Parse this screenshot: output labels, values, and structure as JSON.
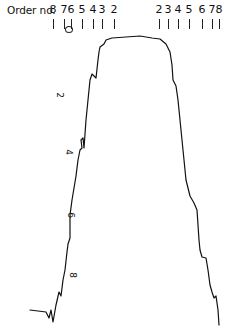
{
  "figure": {
    "order_title": "Order no.",
    "left_orders": [
      {
        "label": "8",
        "x": 53
      },
      {
        "label": "7",
        "x": 64
      },
      {
        "label": "6",
        "x": 71
      },
      {
        "label": "5",
        "x": 82
      },
      {
        "label": "4",
        "x": 93
      },
      {
        "label": "3",
        "x": 102
      },
      {
        "label": "2",
        "x": 114
      }
    ],
    "right_orders": [
      {
        "label": "2",
        "x": 159
      },
      {
        "label": "3",
        "x": 168
      },
      {
        "label": "4",
        "x": 178
      },
      {
        "label": "5",
        "x": 189
      },
      {
        "label": "6",
        "x": 202
      },
      {
        "label": "7",
        "x": 212
      },
      {
        "label": "8",
        "x": 219
      }
    ],
    "zero_marker": "O",
    "inner_labels": [
      {
        "label": "2",
        "x": 57,
        "y": 90
      },
      {
        "label": "4",
        "x": 66,
        "y": 147
      },
      {
        "label": "6",
        "x": 68,
        "y": 210
      },
      {
        "label": "8",
        "x": 70,
        "y": 270
      }
    ],
    "line_color": "#111111"
  },
  "chart_data": {
    "type": "line",
    "title": "Order no.",
    "xlabel": "",
    "ylabel": "",
    "grid": false,
    "legend": "none",
    "top_axis_tick_labels": [
      "8",
      "7",
      "6",
      "5",
      "4",
      "3",
      "2",
      "2",
      "3",
      "4",
      "5",
      "6",
      "7",
      "8"
    ],
    "inner_axis_labels": [
      "2",
      "4",
      "6",
      "8"
    ],
    "series": [
      {
        "name": "band profile (left edge)",
        "points_px": [
          [
            30,
            310
          ],
          [
            46,
            312
          ],
          [
            49,
            318
          ],
          [
            51,
            310
          ],
          [
            53,
            322
          ],
          [
            56,
            305
          ],
          [
            59,
            292
          ],
          [
            61,
            296
          ],
          [
            63,
            280
          ],
          [
            65,
            270
          ],
          [
            67,
            252
          ],
          [
            68,
            244
          ],
          [
            70,
            238
          ],
          [
            70,
            215
          ],
          [
            72,
            200
          ],
          [
            74,
            188
          ],
          [
            76,
            176
          ],
          [
            78,
            160
          ],
          [
            80,
            150
          ],
          [
            82,
            148
          ],
          [
            81,
            140
          ],
          [
            83,
            138
          ],
          [
            84,
            148
          ],
          [
            86,
            120
          ],
          [
            88,
            100
          ],
          [
            90,
            80
          ],
          [
            92,
            74
          ],
          [
            96,
            78
          ],
          [
            98,
            60
          ],
          [
            99,
            52
          ],
          [
            100,
            47
          ],
          [
            104,
            44
          ],
          [
            106,
            40
          ],
          [
            112,
            38
          ]
        ]
      },
      {
        "name": "band profile (plateau)",
        "points_px": [
          [
            112,
            38
          ],
          [
            126,
            37
          ],
          [
            140,
            36
          ],
          [
            152,
            38
          ],
          [
            160,
            39
          ]
        ]
      },
      {
        "name": "band profile (right edge)",
        "points_px": [
          [
            160,
            39
          ],
          [
            166,
            44
          ],
          [
            170,
            52
          ],
          [
            172,
            65
          ],
          [
            173,
            80
          ],
          [
            176,
            86
          ],
          [
            178,
            100
          ],
          [
            180,
            120
          ],
          [
            182,
            140
          ],
          [
            184,
            160
          ],
          [
            186,
            180
          ],
          [
            190,
            196
          ],
          [
            194,
            203
          ],
          [
            197,
            210
          ],
          [
            199,
            240
          ],
          [
            200,
            250
          ],
          [
            202,
            257
          ],
          [
            206,
            258
          ],
          [
            208,
            270
          ],
          [
            210,
            285
          ],
          [
            212,
            292
          ],
          [
            214,
            298
          ],
          [
            216,
            296
          ],
          [
            218,
            310
          ],
          [
            219,
            325
          ]
        ]
      }
    ]
  }
}
